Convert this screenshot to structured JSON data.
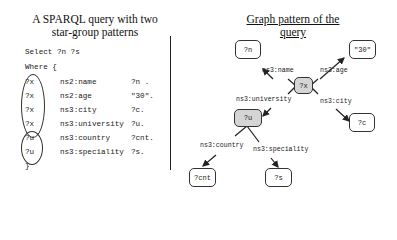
{
  "left_panel": {
    "title_line1": "A SPARQL query with two",
    "title_line2": "star-group patterns",
    "select_line": "Select ?n ?s",
    "where_line": "Where {",
    "closing_brace": "}",
    "triples": [
      {
        "subject": "?x",
        "predicate": "ns2:name",
        "object": "?n ."
      },
      {
        "subject": "?x",
        "predicate": "ns2:age",
        "object": "\"30\"."
      },
      {
        "subject": "?x",
        "predicate": "ns3:city",
        "object": "?c."
      },
      {
        "subject": "?x",
        "predicate": "ns3:university",
        "object": "?u."
      },
      {
        "subject": "?u",
        "predicate": "ns3:country",
        "object": "?cnt."
      },
      {
        "subject": "?u",
        "predicate": "ns3:speciality",
        "object": "?s."
      }
    ]
  },
  "right_panel": {
    "title": "Graph pattern of the query",
    "nodes": {
      "n": "?n",
      "thirty": "\"30\"",
      "x": "?x",
      "u": "?u",
      "c": "?c",
      "cnt": "?cnt",
      "s": "?s"
    },
    "edges": {
      "name": "ns3:name",
      "age": "ns3:age",
      "university": "ns3:university",
      "city": "ns3:city",
      "country": "ns3:country",
      "speciality": "ns3:speciality"
    },
    "colors": {
      "star_center_fill": "#d5d5d5",
      "node_fill": "#ffffff",
      "stroke": "#333333"
    }
  }
}
